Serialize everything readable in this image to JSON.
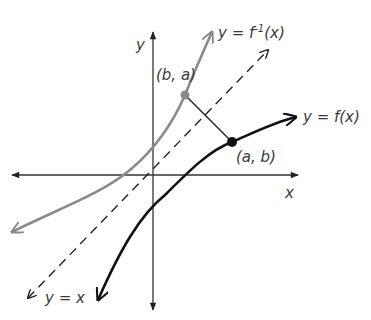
{
  "diagram": {
    "axes": {
      "x_label": "x",
      "y_label": "y"
    },
    "curves": {
      "f": {
        "label": "y = f(x)",
        "color": "#111111"
      },
      "f_inverse": {
        "label_prefix": "y = f",
        "label_sup": "-1",
        "label_suffix": "(x)",
        "color": "#8a8a8a"
      },
      "identity": {
        "label": "y = x",
        "color": "#222222",
        "style": "dashed"
      }
    },
    "points": {
      "a_b": {
        "label": "(a, b)",
        "color": "#111111"
      },
      "b_a": {
        "label": "(b, a)",
        "color": "#8a8a8a"
      }
    }
  }
}
